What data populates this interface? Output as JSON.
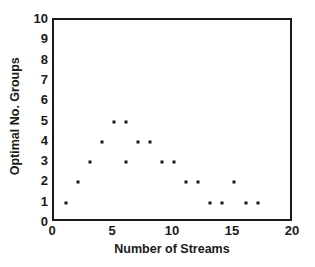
{
  "chart_data": {
    "type": "scatter",
    "title": "",
    "xlabel": "Number of Streams",
    "ylabel": "Optimal No. Groups",
    "xlim": [
      0,
      20
    ],
    "ylim": [
      0,
      10
    ],
    "grid": false,
    "legend": null,
    "x_ticks": [
      0,
      5,
      10,
      15,
      20
    ],
    "x_tick_labels": [
      "0",
      "5",
      "10",
      "15",
      "20"
    ],
    "y_ticks": [
      0,
      1,
      2,
      3,
      4,
      5,
      6,
      7,
      8,
      9,
      10
    ],
    "y_tick_labels": [
      "0",
      "1",
      "2",
      "3",
      "4",
      "5",
      "6",
      "7",
      "8",
      "9",
      "10"
    ],
    "marker": "square",
    "marker_color": "#141414",
    "points": [
      {
        "x": 1,
        "y": 1
      },
      {
        "x": 2,
        "y": 2
      },
      {
        "x": 3,
        "y": 3
      },
      {
        "x": 4,
        "y": 4
      },
      {
        "x": 5,
        "y": 5
      },
      {
        "x": 6,
        "y": 5
      },
      {
        "x": 6,
        "y": 3
      },
      {
        "x": 7,
        "y": 4
      },
      {
        "x": 8,
        "y": 4
      },
      {
        "x": 9,
        "y": 3
      },
      {
        "x": 10,
        "y": 3
      },
      {
        "x": 11,
        "y": 2
      },
      {
        "x": 12,
        "y": 2
      },
      {
        "x": 13,
        "y": 1
      },
      {
        "x": 14,
        "y": 1
      },
      {
        "x": 15,
        "y": 2
      },
      {
        "x": 16,
        "y": 1
      },
      {
        "x": 17,
        "y": 1
      }
    ]
  }
}
